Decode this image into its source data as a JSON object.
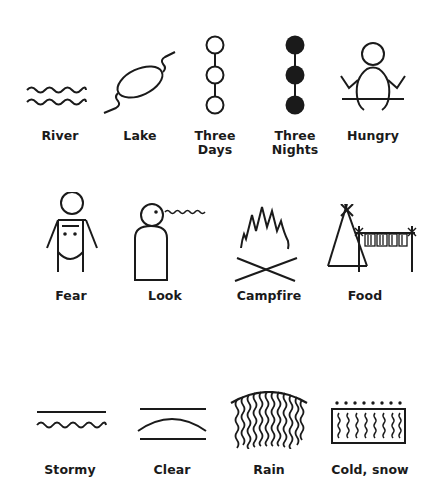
{
  "colors": {
    "ink": "#1a1a1a",
    "background": "#ffffff"
  },
  "rows": [
    {
      "symbols": [
        {
          "id": "river",
          "label": "River",
          "icon": "two-wavy-lines"
        },
        {
          "id": "lake",
          "label": "Lake",
          "icon": "oval-with-streams"
        },
        {
          "id": "three-days",
          "label": "Three\nDays",
          "label_lines": [
            "Three",
            "Days"
          ],
          "icon": "three-open-circles-chain"
        },
        {
          "id": "three-nights",
          "label": "Three\nNights",
          "label_lines": [
            "Three",
            "Nights"
          ],
          "icon": "three-filled-circles-chain"
        },
        {
          "id": "hungry",
          "label": "Hungry",
          "icon": "figure-arms-raised-sitting"
        }
      ]
    },
    {
      "symbols": [
        {
          "id": "fear",
          "label": "Fear",
          "icon": "figure-with-eyes-body"
        },
        {
          "id": "look",
          "label": "Look",
          "icon": "head-with-eye-and-wavy-sight-line"
        },
        {
          "id": "campfire",
          "label": "Campfire",
          "icon": "flames-over-crossed-sticks"
        },
        {
          "id": "food",
          "label": "Food",
          "icon": "tipi-with-drying-rack"
        }
      ]
    },
    {
      "symbols": [
        {
          "id": "stormy",
          "label": "Stormy",
          "icon": "line-over-wavy-line"
        },
        {
          "id": "clear",
          "label": "Clear",
          "icon": "arc-between-lines"
        },
        {
          "id": "rain",
          "label": "Rain",
          "icon": "arc-with-wavy-streaks"
        },
        {
          "id": "cold-snow",
          "label": "Cold, snow",
          "icon": "dots-over-box-with-wavy-lines"
        }
      ]
    }
  ]
}
